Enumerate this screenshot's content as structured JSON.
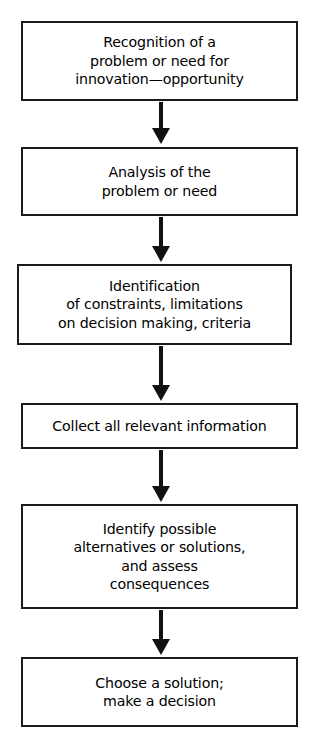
{
  "diagram": {
    "type": "flowchart",
    "orientation": "vertical",
    "title": "",
    "colors": {
      "background": "#ffffff",
      "box_border": "#1b1b1b",
      "box_fill": "#ffffff",
      "text": "#000000",
      "arrow": "#111111"
    },
    "nodes": [
      {
        "id": "node-1",
        "step": 1,
        "text": "Recognition of a\nproblem or need for\ninnovation—opportunity",
        "lines": [
          "Recognition of a",
          "problem or need for",
          "innovation—opportunity"
        ]
      },
      {
        "id": "node-2",
        "step": 2,
        "text": "Analysis of the\nproblem or need",
        "lines": [
          "Analysis of the",
          "problem or need"
        ]
      },
      {
        "id": "node-3",
        "step": 3,
        "text": "Identification\nof constraints, limitations\non decision making, criteria",
        "lines": [
          "Identification",
          "of constraints, limitations",
          "on decision making, criteria"
        ]
      },
      {
        "id": "node-4",
        "step": 4,
        "text": "Collect all relevant information",
        "lines": [
          "Collect all relevant information"
        ]
      },
      {
        "id": "node-5",
        "step": 5,
        "text": "Identify possible\nalternatives or solutions,\nand assess\nconsequences",
        "lines": [
          "Identify possible",
          "alternatives or solutions,",
          "and assess",
          "consequences"
        ]
      },
      {
        "id": "node-6",
        "step": 6,
        "text": "Choose a solution;\nmake a decision",
        "lines": [
          "Choose a solution;",
          "make a decision"
        ]
      }
    ],
    "connectors": [
      {
        "id": "arrow-1",
        "from": "node-1",
        "to": "node-2",
        "icon": "down-arrow-icon"
      },
      {
        "id": "arrow-2",
        "from": "node-2",
        "to": "node-3",
        "icon": "down-arrow-icon"
      },
      {
        "id": "arrow-3",
        "from": "node-3",
        "to": "node-4",
        "icon": "down-arrow-icon"
      },
      {
        "id": "arrow-4",
        "from": "node-4",
        "to": "node-5",
        "icon": "down-arrow-icon"
      },
      {
        "id": "arrow-5",
        "from": "node-5",
        "to": "node-6",
        "icon": "down-arrow-icon"
      }
    ]
  }
}
